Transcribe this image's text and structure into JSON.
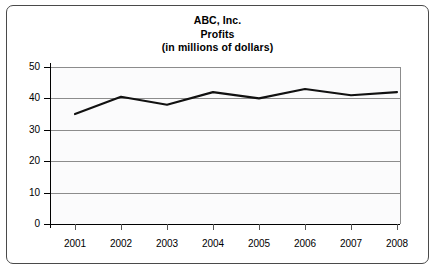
{
  "chart_data": {
    "type": "line",
    "title": "ABC, Inc.",
    "subtitle": "Profits",
    "units_note": "(in millions of dollars)",
    "xlabel": "",
    "ylabel": "",
    "categories": [
      "2001",
      "2002",
      "2003",
      "2004",
      "2005",
      "2006",
      "2007",
      "2008"
    ],
    "values": [
      35,
      40.5,
      38,
      42,
      40,
      43,
      41,
      42
    ],
    "series": [
      {
        "name": "Profits",
        "values": [
          35,
          40.5,
          38,
          42,
          40,
          43,
          41,
          42
        ]
      }
    ],
    "ylim": [
      0,
      50
    ],
    "yticks": [
      0,
      10,
      20,
      30,
      40,
      50
    ],
    "ytick_labels": [
      "0",
      "10",
      "20",
      "30",
      "40",
      "50"
    ],
    "grid": true,
    "grid_axis": "y",
    "legend": false,
    "legend_position": "none",
    "line_color": "#111111",
    "grid_color": "#8c8c8c",
    "axis_color": "#000000",
    "plot_background": "#fbfbfc",
    "frame_color": "#4a4a4a"
  }
}
